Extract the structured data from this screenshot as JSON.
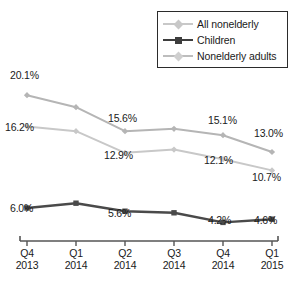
{
  "chart_data": {
    "type": "line",
    "title": "",
    "subtitle": "",
    "xlabel": "",
    "ylabel": "",
    "grid": false,
    "legend_position": "top-right",
    "categories": [
      "Q4 2013",
      "Q1 2014",
      "Q2 2014",
      "Q3 2014",
      "Q4 2014",
      "Q1 2015"
    ],
    "x_tick_quarters": [
      "Q4",
      "Q1",
      "Q2",
      "Q3",
      "Q4",
      "Q1"
    ],
    "x_tick_years": [
      "2013",
      "2014",
      "2014",
      "2014",
      "2014",
      "2015"
    ],
    "ylim": [
      0,
      22
    ],
    "series": [
      {
        "name": "Nonelderly adults",
        "color": "#b5b5b5",
        "marker": "diamond",
        "values": [
          20.1,
          18.6,
          15.6,
          15.9,
          15.1,
          13.0
        ],
        "labels": [
          "20.1%",
          "",
          "15.6%",
          "",
          "15.1%",
          "13.0%"
        ]
      },
      {
        "name": "All nonelderly",
        "color": "#c8c8c8",
        "marker": "diamond",
        "values": [
          16.2,
          15.6,
          12.9,
          13.3,
          12.1,
          10.7
        ],
        "labels": [
          "16.2%",
          "",
          "12.9%",
          "",
          "12.1%",
          "10.7%"
        ]
      },
      {
        "name": "Children",
        "color": "#4a4a4a",
        "marker": "square",
        "values": [
          6.0,
          6.6,
          5.6,
          5.4,
          4.2,
          4.6
        ],
        "labels": [
          "6.0%",
          "",
          "5.6%",
          "",
          "4.2%",
          "4.6%"
        ]
      }
    ],
    "annotations": [
      {
        "text": "20.1%",
        "x": 10,
        "y": 70
      },
      {
        "text": "16.2%",
        "x": 5,
        "y": 122
      },
      {
        "text": "15.6%",
        "x": 108,
        "y": 113
      },
      {
        "text": "12.9%",
        "x": 104,
        "y": 150
      },
      {
        "text": "15.1%",
        "x": 208,
        "y": 115
      },
      {
        "text": "13.0%",
        "x": 254,
        "y": 128
      },
      {
        "text": "12.1%",
        "x": 204,
        "y": 155
      },
      {
        "text": "10.7%",
        "x": 252,
        "y": 172
      },
      {
        "text": "6.0%",
        "x": 10,
        "y": 203
      },
      {
        "text": "5.6%",
        "x": 108,
        "y": 208
      },
      {
        "text": "4.2%",
        "x": 208,
        "y": 215
      },
      {
        "text": "4.6%",
        "x": 254,
        "y": 215
      }
    ]
  },
  "legend": {
    "items": [
      {
        "label": "All nonelderly",
        "color": "#c8c8c8",
        "marker": "diamond"
      },
      {
        "label": "Children",
        "color": "#3d3d3d",
        "marker": "square"
      },
      {
        "label": "Nonelderly adults",
        "color": "#bdbdbd",
        "marker": "diamond"
      }
    ]
  },
  "axis": {
    "line_color": "#555555"
  },
  "caption": {
    "text": ""
  }
}
